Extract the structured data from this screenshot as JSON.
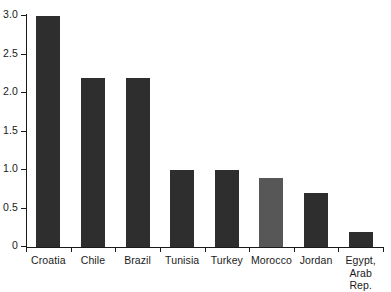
{
  "chart_data": {
    "type": "bar",
    "title": "",
    "subtitle": "",
    "xlabel": "",
    "ylabel": "",
    "categories": [
      "Croatia",
      "Chile",
      "Brazil",
      "Tunisia",
      "Turkey",
      "Morocco",
      "Jordan",
      "Egypt, Arab Rep."
    ],
    "category_lines": [
      [
        "Croatia"
      ],
      [
        "Chile"
      ],
      [
        "Brazil"
      ],
      [
        "Tunisia"
      ],
      [
        "Turkey"
      ],
      [
        "Morocco"
      ],
      [
        "Jordan"
      ],
      [
        "Egypt,",
        "Arab Rep."
      ]
    ],
    "values": [
      3.0,
      2.2,
      2.2,
      1.0,
      1.0,
      0.9,
      0.7,
      0.2
    ],
    "bar_colors": [
      "#2e2e2e",
      "#2e2e2e",
      "#2e2e2e",
      "#2e2e2e",
      "#2e2e2e",
      "#575757",
      "#2e2e2e",
      "#2e2e2e"
    ],
    "ylim": [
      0,
      3.0
    ],
    "yticks": [
      3.0,
      2.5,
      2.0,
      1.5,
      1.0,
      0.5,
      0
    ],
    "ytick_labels": [
      "3.0",
      "2.5",
      "2.0",
      "1.5",
      "1.0",
      "0.5",
      "0"
    ],
    "grid": false,
    "legend": null,
    "legend_position": "none",
    "annotations": []
  },
  "colors": {
    "background": "#ffffff",
    "axis": "#1a1a1a",
    "bar_dark": "#2e2e2e",
    "bar_light": "#575757",
    "text": "#1a1a1a"
  }
}
